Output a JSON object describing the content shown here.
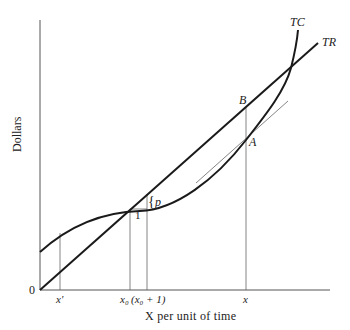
{
  "diagram": {
    "type": "economics-cost-revenue",
    "y_axis_label": "Dollars",
    "x_axis_label": "X per unit of time",
    "origin_label": "0",
    "curves": {
      "tc_label": "TC",
      "tr_label": "TR"
    },
    "points": {
      "a_label": "A",
      "b_label": "B"
    },
    "annotations": {
      "step_run_label": "1",
      "step_rise_brace": "{",
      "step_rise_label": "p"
    },
    "x_ticks": {
      "x_prime": "x′",
      "x0": "x₀",
      "x0_plus_1": "(x₀ + 1)",
      "x": "x"
    },
    "colors": {
      "curve": "#1a1a1a",
      "guide": "#555555",
      "background": "#ffffff"
    }
  }
}
